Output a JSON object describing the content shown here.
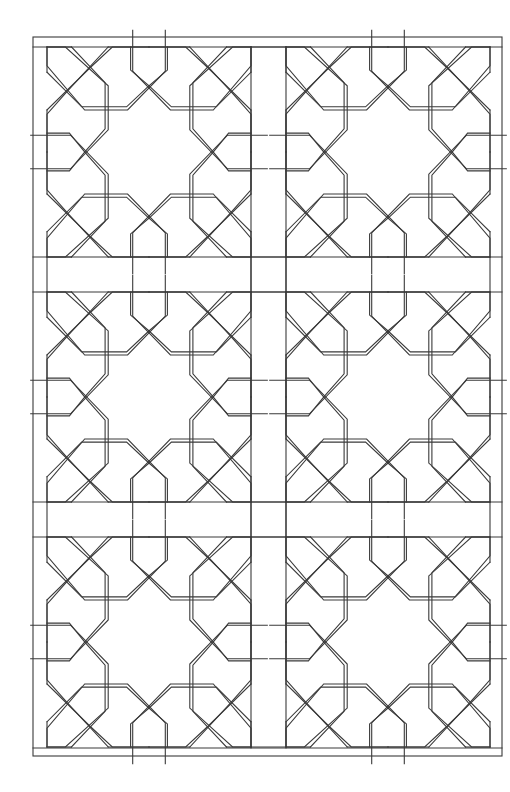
{
  "drawing": {
    "subject": "geometric lattice pattern line drawing",
    "background": "#ffffff",
    "stroke_color": "#3a3a3a",
    "stroke_width": 1.1,
    "frame": {
      "outer": {
        "x": 33,
        "y": 37,
        "w": 469,
        "h": 719
      },
      "inner_top_y": 47,
      "inner_bottom_y": 748
    },
    "grid": {
      "columns": 2,
      "rows": 3,
      "tile_origins_x": [
        47,
        286
      ],
      "tile_origins_y": [
        47,
        292,
        537
      ],
      "tile_width": 204,
      "tile_height": 210
    },
    "quadrant_polylines": [
      [
        [
          0,
          0
        ],
        [
          0,
          18
        ],
        [
          37,
          60
        ],
        [
          79,
          60
        ],
        [
          116,
          23
        ],
        [
          116,
          -16
        ]
      ],
      [
        [
          24,
          0
        ],
        [
          57,
          34
        ],
        [
          57,
          78
        ],
        [
          37,
          100
        ]
      ],
      [
        [
          60,
          0
        ],
        [
          20,
          42
        ],
        [
          0,
          64
        ],
        [
          0,
          100
        ]
      ],
      [
        [
          0,
          82
        ],
        [
          22,
          82
        ],
        [
          37,
          100
        ]
      ],
      [
        [
          0,
          0
        ],
        [
          24,
          0
        ]
      ],
      [
        [
          60,
          0
        ],
        [
          100,
          0
        ]
      ]
    ]
  }
}
